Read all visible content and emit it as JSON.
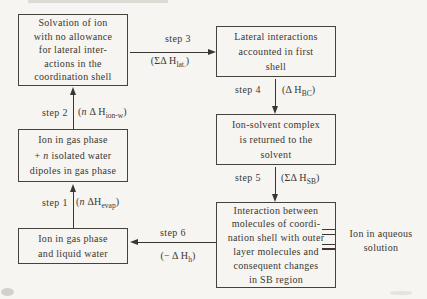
{
  "figure": {
    "colors": {
      "paper": "#f6f5f1",
      "ink": "#3a3732"
    },
    "boxes": [
      {
        "lines": [
          "Solvation of ion",
          "with no allowance",
          "for lateral inter-",
          "actions in the",
          "coordination shell"
        ]
      },
      {
        "lines": [
          "Lateral interactions",
          "accounted in first",
          "shell"
        ]
      },
      {
        "lines": [
          "Ion-solvent complex",
          "is returned to the",
          "solvent"
        ]
      },
      {
        "line1": "Ion in gas phase",
        "line2_pre": "+ ",
        "line2_n": "n",
        "line2_post": " isolated water",
        "line3": "dipoles in gas phase"
      },
      {
        "lines": [
          "Ion in gas phase",
          "and liquid water"
        ]
      },
      {
        "lines": [
          "Interaction between",
          "molecules of coordi-",
          "nation shell with outer",
          "layer molecules and",
          "consequent changes",
          "in SB region"
        ]
      }
    ],
    "steps": [
      {
        "label": "step 1",
        "pre": "(",
        "n": "n",
        "mid": " ΔH",
        "sub": "evap",
        "post": ")"
      },
      {
        "label": "step 2",
        "pre": "(",
        "n": "n",
        "mid": " Δ H",
        "sub": "ion-w",
        "post": ")"
      },
      {
        "label": "step 3",
        "pre": "(ΣΔ H",
        "sub": "lat.",
        "post": ")"
      },
      {
        "label": "step 4",
        "pre": "(Δ H",
        "sub": "BC",
        "post": ")"
      },
      {
        "label": "step 5",
        "pre": "(ΣΔ H",
        "sub": "SB",
        "post": ")"
      },
      {
        "label": "step 6",
        "pre": "(− Δ H",
        "sub": "h",
        "post": ")"
      }
    ],
    "aqueous": {
      "line1": "Ion in aqueous",
      "line2": "solution"
    }
  }
}
